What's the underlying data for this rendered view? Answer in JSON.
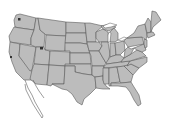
{
  "map": {
    "title": "United States map",
    "colors": {
      "background": "#ffffff",
      "state_fill": "#bcbcbc",
      "state_border": "#5a5a5a",
      "marker": "#333333"
    },
    "markers": [
      {
        "name": "marker-washington",
        "x": 19,
        "y": 19
      },
      {
        "name": "marker-utah",
        "x": 41,
        "y": 48
      },
      {
        "name": "marker-california",
        "x": 11,
        "y": 57
      }
    ]
  }
}
